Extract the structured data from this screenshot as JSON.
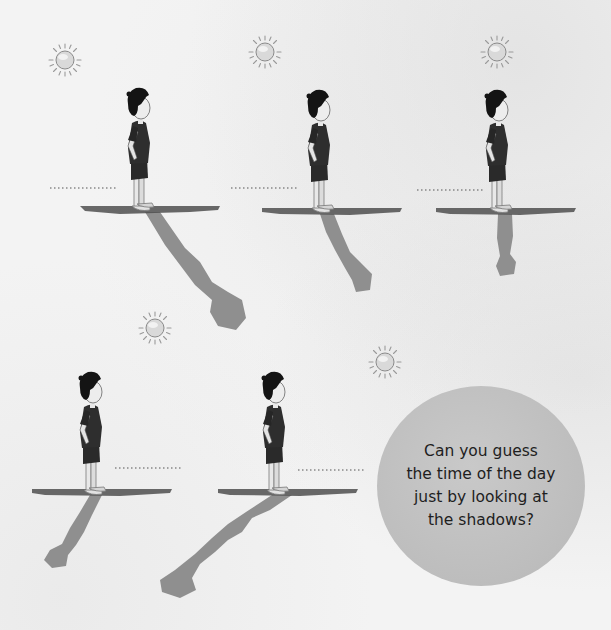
{
  "question": {
    "lines": [
      "Can you guess",
      "the time of the day",
      "just by looking at",
      "the shadows?"
    ]
  },
  "scenes": [
    {
      "id": 1,
      "label_blank": "................",
      "sun": "low-left",
      "shadow": "long-diagonal-right"
    },
    {
      "id": 2,
      "label_blank": "................",
      "sun": "mid-left",
      "shadow": "medium-diagonal-right"
    },
    {
      "id": 3,
      "label_blank": "................",
      "sun": "overhead",
      "shadow": "short-down"
    },
    {
      "id": 4,
      "label_blank": "................",
      "sun": "mid-right",
      "shadow": "medium-diagonal-left"
    },
    {
      "id": 5,
      "label_blank": "................",
      "sun": "low-right",
      "shadow": "long-diagonal-left"
    }
  ],
  "colors": {
    "background": "#f3f3f3",
    "bubble": "#c2c2c2",
    "shadow": "#8f8f8f",
    "ground": "#5a5a5a",
    "figure": "#222222"
  },
  "icons": [
    "sun-icon",
    "child-figure",
    "shadow-shape"
  ]
}
